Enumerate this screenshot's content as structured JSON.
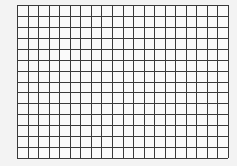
{
  "image": {
    "width": 237,
    "height": 166,
    "background_color": "#f3f3f3"
  },
  "grid": {
    "left": 17,
    "top": 5,
    "right": 228,
    "bottom": 158,
    "columns": 20,
    "rows": 14,
    "cell_fill": "#fafafa",
    "line_color": "#3a3a3a",
    "line_width": 1
  }
}
